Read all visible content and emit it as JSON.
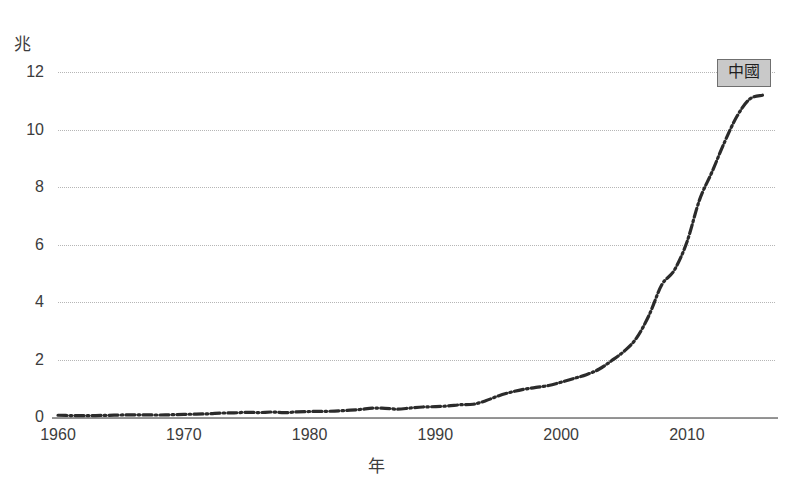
{
  "chart_data": {
    "type": "line",
    "title": "",
    "subtitle": "",
    "xlabel": "年",
    "ylabel": "兆",
    "unit_label": "兆",
    "xlim": [
      1960,
      2017
    ],
    "ylim": [
      0,
      12
    ],
    "grid": true,
    "legend_position": "inline-right",
    "yticks": [
      "12",
      "10",
      "8",
      "6",
      "4",
      "2",
      "0"
    ],
    "ytick_values": [
      12,
      10,
      8,
      6,
      4,
      2,
      0
    ],
    "xticks": [
      "1960",
      "1970",
      "1980",
      "1990",
      "2000",
      "2010"
    ],
    "xtick_values": [
      1960,
      1970,
      1980,
      1990,
      2000,
      2010
    ],
    "series": [
      {
        "name": "中國",
        "label": "中國",
        "color": "#2b2b2b",
        "linestyle": "dash-dot",
        "x": [
          1960,
          1961,
          1962,
          1963,
          1964,
          1965,
          1966,
          1967,
          1968,
          1969,
          1970,
          1971,
          1972,
          1973,
          1974,
          1975,
          1976,
          1977,
          1978,
          1979,
          1980,
          1981,
          1982,
          1983,
          1984,
          1985,
          1986,
          1987,
          1988,
          1989,
          1990,
          1991,
          1992,
          1993,
          1994,
          1995,
          1996,
          1997,
          1998,
          1999,
          2000,
          2001,
          2002,
          2003,
          2004,
          2005,
          2006,
          2007,
          2008,
          2009,
          2010,
          2011,
          2012,
          2013,
          2014,
          2015,
          2016
        ],
        "values": [
          0.06,
          0.05,
          0.047,
          0.051,
          0.059,
          0.07,
          0.076,
          0.073,
          0.07,
          0.079,
          0.093,
          0.099,
          0.113,
          0.137,
          0.144,
          0.164,
          0.154,
          0.174,
          0.15,
          0.178,
          0.191,
          0.195,
          0.205,
          0.23,
          0.26,
          0.309,
          0.301,
          0.273,
          0.312,
          0.348,
          0.361,
          0.383,
          0.427,
          0.444,
          0.564,
          0.734,
          0.863,
          0.962,
          1.029,
          1.094,
          1.211,
          1.339,
          1.471,
          1.66,
          1.955,
          2.286,
          2.752,
          3.552,
          4.598,
          5.11,
          6.088,
          7.552,
          8.532,
          9.57,
          10.476,
          11.062,
          11.191
        ]
      }
    ]
  },
  "annotations": {
    "series_label_box": {
      "text": "中國",
      "fill_color": "#c9c9c9",
      "border_color": "#6f6f6f",
      "text_color": "#1f1f1f"
    }
  },
  "style": {
    "background": "#ffffff",
    "gridline_color": "#b6b6b6",
    "axis_color": "#8d8d8d",
    "tick_text_color": "#3c3c3c",
    "line_color": "#2b2b2b"
  }
}
